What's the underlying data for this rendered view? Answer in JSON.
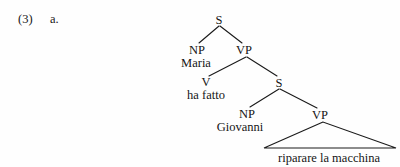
{
  "example": {
    "number": "(3)",
    "letter": "a."
  },
  "tree": {
    "nodes": [
      {
        "id": "S1",
        "label": "S",
        "x": 219,
        "y": 20,
        "type": "category"
      },
      {
        "id": "NP1",
        "label": "NP",
        "x": 197,
        "y": 50,
        "type": "category"
      },
      {
        "id": "VP1",
        "label": "VP",
        "x": 244,
        "y": 50,
        "type": "category"
      },
      {
        "id": "V1",
        "label": "V",
        "x": 206,
        "y": 82,
        "type": "category"
      },
      {
        "id": "S2",
        "label": "S",
        "x": 279,
        "y": 83,
        "type": "category"
      },
      {
        "id": "NP2",
        "label": "NP",
        "x": 247,
        "y": 114,
        "type": "category"
      },
      {
        "id": "VP2",
        "label": "VP",
        "x": 320,
        "y": 115,
        "type": "category"
      }
    ],
    "terminals": [
      {
        "id": "T1",
        "label": "Maria",
        "parent": "NP1",
        "x": 196,
        "y": 64
      },
      {
        "id": "T2",
        "label": "ha fatto",
        "parent": "V1",
        "x": 206,
        "y": 96
      },
      {
        "id": "T3",
        "label": "Giovanni",
        "parent": "NP2",
        "x": 240,
        "y": 128
      },
      {
        "id": "T4",
        "label": "riparare la macchina",
        "parent": "VP2",
        "x": 329,
        "y": 162
      }
    ],
    "edges": [
      {
        "from": "S1",
        "to": "NP1"
      },
      {
        "from": "S1",
        "to": "VP1"
      },
      {
        "from": "VP1",
        "to": "V1"
      },
      {
        "from": "VP1",
        "to": "S2"
      },
      {
        "from": "S2",
        "to": "NP2"
      },
      {
        "from": "S2",
        "to": "VP2"
      }
    ],
    "triangle": {
      "apex_x": 323,
      "apex_y": 131,
      "left_x": 264,
      "right_x": 396,
      "base_y": 148,
      "covers": "riparare la macchina"
    },
    "line_color": "#1a1a1a"
  }
}
